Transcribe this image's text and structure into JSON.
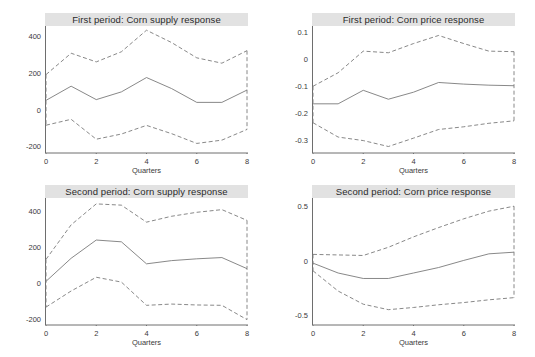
{
  "figure": {
    "width": 535,
    "height": 357,
    "background": "#ffffff",
    "title_bar_color": "#e2e2e2",
    "line_color": "#7a7a7a",
    "axis_color": "#6e6e6e",
    "text_color": "#3a3a3a"
  },
  "chart_data": [
    {
      "id": "first-period-corn-supply",
      "type": "line",
      "title": "First period: Corn supply response",
      "xlabel": "Quarters",
      "ylabel": "",
      "xlim": [
        0,
        8
      ],
      "ylim": [
        -230,
        460
      ],
      "xticks": [
        0,
        2,
        4,
        6,
        8
      ],
      "xtick_labels": [
        "0",
        "2",
        "4",
        "6",
        "8"
      ],
      "yticks": [
        -200,
        0,
        200,
        400
      ],
      "ytick_labels": [
        "-200",
        "0",
        "200",
        "400"
      ],
      "grid": false,
      "legend": "none",
      "x": [
        0,
        1,
        2,
        3,
        4,
        5,
        6,
        7,
        8
      ],
      "series": [
        {
          "name": "upper 95% CI",
          "style": "dashed",
          "values": [
            196,
            312,
            265,
            320,
            437,
            370,
            287,
            258,
            326
          ]
        },
        {
          "name": "point estimate",
          "style": "solid",
          "values": [
            56,
            133,
            60,
            102,
            180,
            120,
            45,
            45,
            112
          ]
        },
        {
          "name": "lower 95% CI",
          "style": "dashed",
          "values": [
            -79,
            -47,
            -155,
            -127,
            -80,
            -125,
            -178,
            -160,
            -102
          ]
        }
      ],
      "endpoint_drops": [
        {
          "x": 0,
          "from": 196,
          "to": -79
        },
        {
          "x": 8,
          "from": 326,
          "to": -102
        }
      ]
    },
    {
      "id": "first-period-corn-price",
      "type": "line",
      "title": "First period: Corn price response",
      "xlabel": "Quarters",
      "ylabel": "",
      "xlim": [
        0,
        8
      ],
      "ylim": [
        -0.345,
        0.125
      ],
      "xticks": [
        0,
        2,
        4,
        6,
        8
      ],
      "xtick_labels": [
        "0",
        "2",
        "4",
        "6",
        "8"
      ],
      "yticks": [
        -0.3,
        -0.2,
        -0.1,
        0,
        0.1
      ],
      "ytick_labels": [
        "-0.3",
        "-0.2",
        "-0.1",
        "0",
        "0.1"
      ],
      "grid": false,
      "legend": "none",
      "x": [
        0,
        1,
        2,
        3,
        4,
        5,
        6,
        7,
        8
      ],
      "series": [
        {
          "name": "upper 95% CI",
          "style": "dashed",
          "values": [
            -0.098,
            -0.048,
            0.032,
            0.026,
            0.06,
            0.09,
            0.06,
            0.032,
            0.03
          ]
        },
        {
          "name": "point estimate",
          "style": "solid",
          "values": [
            -0.163,
            -0.163,
            -0.113,
            -0.146,
            -0.12,
            -0.084,
            -0.09,
            -0.094,
            -0.096
          ]
        },
        {
          "name": "lower 95% CI",
          "style": "dashed",
          "values": [
            -0.233,
            -0.286,
            -0.299,
            -0.321,
            -0.29,
            -0.258,
            -0.248,
            -0.235,
            -0.226
          ]
        }
      ],
      "endpoint_drops": [
        {
          "x": 0,
          "from": -0.098,
          "to": -0.233
        },
        {
          "x": 8,
          "from": 0.03,
          "to": -0.226
        }
      ]
    },
    {
      "id": "second-period-corn-supply",
      "type": "line",
      "title": "Second period: Corn supply response",
      "xlabel": "Quarters",
      "ylabel": "",
      "xlim": [
        0,
        8
      ],
      "ylim": [
        -230,
        480
      ],
      "xticks": [
        0,
        2,
        4,
        6,
        8
      ],
      "xtick_labels": [
        "0",
        "2",
        "4",
        "6",
        "8"
      ],
      "yticks": [
        -200,
        0,
        200,
        400
      ],
      "ytick_labels": [
        "-200",
        "0",
        "200",
        "400"
      ],
      "grid": false,
      "legend": "none",
      "x": [
        0,
        1,
        2,
        3,
        4,
        5,
        6,
        7,
        8
      ],
      "series": [
        {
          "name": "upper 95% CI",
          "style": "dashed",
          "values": [
            137,
            330,
            447,
            440,
            345,
            378,
            400,
            415,
            355
          ]
        },
        {
          "name": "point estimate",
          "style": "solid",
          "values": [
            14,
            143,
            245,
            235,
            112,
            130,
            140,
            147,
            85
          ]
        },
        {
          "name": "lower 95% CI",
          "style": "dashed",
          "values": [
            -130,
            -40,
            37,
            10,
            -120,
            -113,
            -118,
            -120,
            -200
          ]
        }
      ],
      "endpoint_drops": [
        {
          "x": 0,
          "from": 137,
          "to": -130
        },
        {
          "x": 8,
          "from": 355,
          "to": -200
        }
      ]
    },
    {
      "id": "second-period-corn-price",
      "type": "line",
      "title": "Second period: Corn price response",
      "xlabel": "Quarters",
      "ylabel": "",
      "xlim": [
        0,
        8
      ],
      "ylim": [
        -0.58,
        0.58
      ],
      "xticks": [
        0,
        2,
        4,
        6,
        8
      ],
      "xtick_labels": [
        "0",
        "2",
        "4",
        "6",
        "8"
      ],
      "yticks": [
        -0.5,
        0,
        0.5
      ],
      "ytick_labels": [
        "-0.5",
        "0",
        "0.5"
      ],
      "grid": false,
      "legend": "none",
      "x": [
        0,
        1,
        2,
        3,
        4,
        5,
        6,
        7,
        8
      ],
      "series": [
        {
          "name": "upper 95% CI",
          "style": "dashed",
          "values": [
            0.065,
            0.06,
            0.055,
            0.13,
            0.225,
            0.31,
            0.39,
            0.46,
            0.505
          ]
        },
        {
          "name": "point estimate",
          "style": "solid",
          "values": [
            -0.015,
            -0.105,
            -0.155,
            -0.155,
            -0.105,
            -0.055,
            0.01,
            0.07,
            0.085
          ]
        },
        {
          "name": "lower 95% CI",
          "style": "dashed",
          "values": [
            -0.085,
            -0.27,
            -0.39,
            -0.44,
            -0.42,
            -0.395,
            -0.375,
            -0.35,
            -0.33
          ]
        }
      ],
      "endpoint_drops": [
        {
          "x": 0,
          "from": 0.065,
          "to": -0.085
        },
        {
          "x": 8,
          "from": 0.505,
          "to": -0.33
        }
      ]
    }
  ]
}
